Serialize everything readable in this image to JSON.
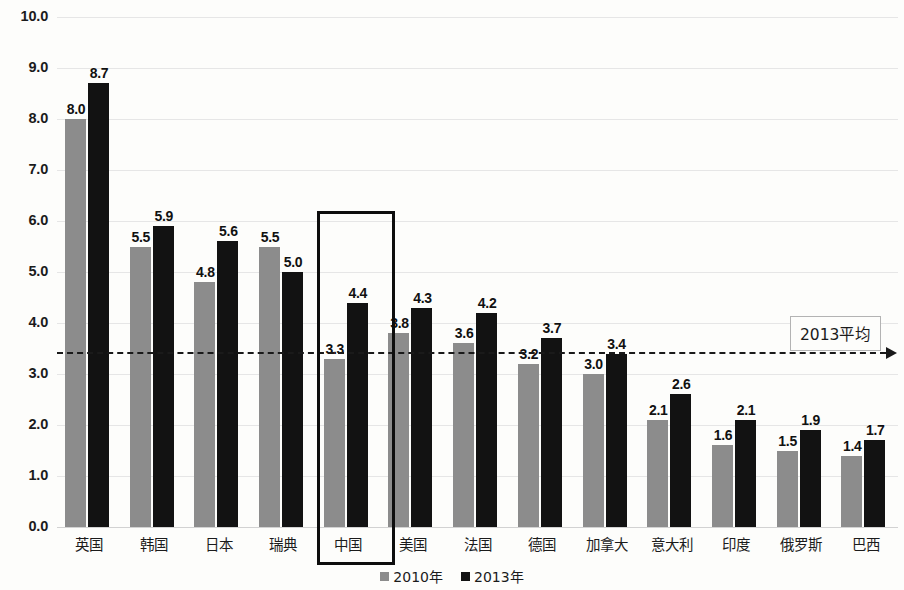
{
  "chart_data": {
    "type": "bar",
    "title": "",
    "subtitle": "",
    "xlabel": "",
    "ylabel": "",
    "ylim": [
      0.0,
      10.0
    ],
    "ytick_labels": [
      "10.0",
      "9.0",
      "8.0",
      "7.0",
      "6.0",
      "5.0",
      "4.0",
      "3.0",
      "2.0",
      "1.0",
      "0.0"
    ],
    "ytick_values": [
      10.0,
      9.0,
      8.0,
      7.0,
      6.0,
      5.0,
      4.0,
      3.0,
      2.0,
      1.0,
      0.0
    ],
    "grid": true,
    "legend_position": "bottom-center",
    "categories": [
      "英国",
      "韩国",
      "日本",
      "瑞典",
      "中国",
      "美国",
      "法国",
      "德国",
      "加拿大",
      "意大利",
      "印度",
      "俄罗斯",
      "巴西"
    ],
    "series": [
      {
        "name": "2010年",
        "color": "#8c8c8c",
        "values": [
          8.0,
          5.5,
          4.8,
          5.5,
          3.3,
          3.8,
          3.6,
          3.2,
          3.0,
          2.1,
          1.6,
          1.5,
          1.4
        ],
        "labels": [
          "8.0",
          "5.5",
          "4.8",
          "5.5",
          "3.3",
          "3.8",
          "3.6",
          "3.2",
          "3.0",
          "2.1",
          "1.6",
          "1.5",
          "1.4"
        ]
      },
      {
        "name": "2013年",
        "color": "#121212",
        "values": [
          8.7,
          5.9,
          5.6,
          5.0,
          4.4,
          4.3,
          4.2,
          3.7,
          3.4,
          2.6,
          2.1,
          1.9,
          1.7
        ],
        "labels": [
          "8.7",
          "5.9",
          "5.6",
          "5.0",
          "4.4",
          "4.3",
          "4.2",
          "3.7",
          "3.4",
          "2.6",
          "2.1",
          "1.9",
          "1.7"
        ]
      }
    ],
    "annotations": [
      {
        "name": "average-line",
        "type": "hline-arrow",
        "value": 3.43,
        "label": "2013平均",
        "style": "dashed",
        "color": "#1a1a1a"
      },
      {
        "name": "highlight-box",
        "type": "rect",
        "category": "中国",
        "color": "#0d0d0d"
      }
    ]
  },
  "legend": {
    "items": [
      {
        "label": "2010年",
        "color": "#8c8c8c"
      },
      {
        "label": "2013年",
        "color": "#121212"
      }
    ]
  },
  "callout": {
    "text": "2013平均"
  }
}
